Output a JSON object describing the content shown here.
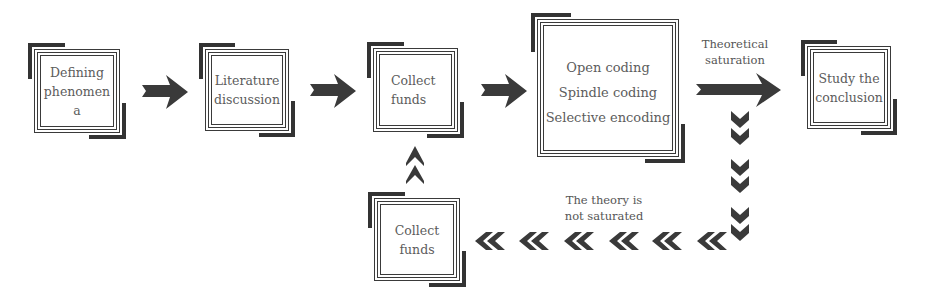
{
  "diagram": {
    "title": "",
    "nodes": [
      {
        "id": "defining",
        "lines": [
          "Defining",
          "phenomen",
          "a"
        ]
      },
      {
        "id": "literature",
        "lines": [
          "Literature",
          "discussion"
        ]
      },
      {
        "id": "collect1",
        "lines": [
          "Collect",
          "funds"
        ]
      },
      {
        "id": "coding",
        "lines": [
          "Open coding",
          "Spindle coding",
          "Selective encoding"
        ]
      },
      {
        "id": "conclusion",
        "lines": [
          "Study the",
          "conclusion"
        ]
      },
      {
        "id": "collect2",
        "lines": [
          "Collect",
          "funds"
        ]
      }
    ],
    "edges": [
      {
        "from": "defining",
        "to": "literature",
        "style": "arrow"
      },
      {
        "from": "literature",
        "to": "collect1",
        "style": "arrow"
      },
      {
        "from": "collect1",
        "to": "coding",
        "style": "arrow"
      },
      {
        "from": "coding",
        "to": "conclusion",
        "style": "arrow",
        "label": [
          "Theoretical",
          "saturation"
        ]
      },
      {
        "from": "coding",
        "to": "collect2",
        "style": "chevrons",
        "label": [
          "The theory is",
          "not saturated"
        ]
      },
      {
        "from": "collect2",
        "to": "collect1",
        "style": "chevrons-up"
      }
    ],
    "labels": {
      "saturation": [
        "Theoretical",
        "saturation"
      ],
      "not_saturated": [
        "The theory is",
        "not saturated"
      ]
    },
    "colors": {
      "ink": "#333333",
      "text": "#5c5c5c",
      "background": "#ffffff"
    }
  }
}
